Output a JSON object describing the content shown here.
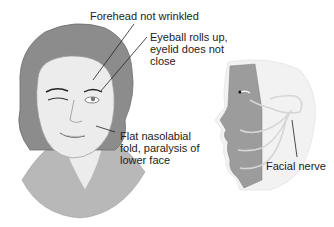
{
  "diagram": {
    "labels": {
      "forehead": "Forehead not wrinkled",
      "eyeball": "Eyeball rolls up,\neyelid does not\nclose",
      "nasolabial": "Flat nasolabial\nfold, paralysis of\nlower face",
      "facial_nerve": "Facial nerve"
    },
    "colors": {
      "hair": "#8a8a8a",
      "skin": "#e8e8e8",
      "shirt": "#b5b5b5",
      "muscle": "#9a9a9a",
      "nerve": "#d9d9d9",
      "leader_line": "#222222"
    }
  }
}
